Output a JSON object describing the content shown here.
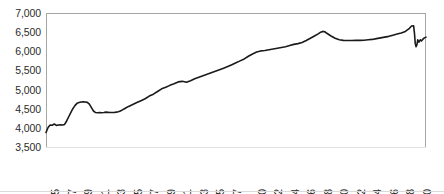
{
  "chart_data": {
    "type": "line",
    "title": "",
    "subtitle": "",
    "xlabel": "",
    "ylabel": "",
    "ylim": [
      3500,
      7000
    ],
    "ytick_labels": [
      "7,000",
      "6,500",
      "6,000",
      "5,500",
      "5,000",
      "4,500",
      "4,000",
      "3,500"
    ],
    "ytick_values": [
      7000,
      6500,
      6000,
      5500,
      5000,
      4500,
      4000,
      3500
    ],
    "xtick_labels": [
      "1975",
      "1977",
      "1979",
      "1981",
      "1983",
      "1985",
      "1987",
      "1989",
      "1991",
      "1993",
      "1995",
      "1997",
      "2000",
      "2002",
      "2004",
      "2006",
      "2008",
      "2010",
      "2012",
      "2014",
      "2016",
      "2018",
      "2020"
    ],
    "xtick_values": [
      1975,
      1977,
      1979,
      1981,
      1983,
      1985,
      1987,
      1989,
      1991,
      1993,
      1995,
      1997,
      2000,
      2002,
      2004,
      2006,
      2008,
      2010,
      2012,
      2014,
      2016,
      2018,
      2020
    ],
    "xlim": [
      1975,
      2021
    ],
    "grid": false,
    "legend": null,
    "line_color": "#1a1a1a",
    "line_width": 1.6,
    "axis_color": "#a6a6a6",
    "series": [
      {
        "name": "series-1",
        "x": [
          1975.0,
          1975.25,
          1975.5,
          1975.75,
          1976.0,
          1976.25,
          1976.5,
          1976.75,
          1977.0,
          1977.25,
          1977.5,
          1977.75,
          1978.0,
          1978.25,
          1978.5,
          1978.75,
          1979.0,
          1979.25,
          1979.5,
          1979.75,
          1980.0,
          1980.25,
          1980.5,
          1980.75,
          1981.0,
          1981.25,
          1981.5,
          1981.75,
          1982.0,
          1982.25,
          1982.5,
          1982.75,
          1983.0,
          1983.25,
          1983.5,
          1983.75,
          1984.0,
          1984.25,
          1984.5,
          1984.75,
          1985.0,
          1985.5,
          1986.0,
          1986.5,
          1987.0,
          1987.5,
          1988.0,
          1988.5,
          1989.0,
          1989.5,
          1990.0,
          1990.5,
          1991.0,
          1991.5,
          1992.0,
          1992.5,
          1993.0,
          1993.5,
          1994.0,
          1994.5,
          1995.0,
          1995.5,
          1996.0,
          1996.5,
          1997.0,
          1997.5,
          1998.0,
          1998.5,
          1999.0,
          1999.5,
          2000.0,
          2000.5,
          2001.0,
          2001.5,
          2002.0,
          2002.5,
          2003.0,
          2003.5,
          2004.0,
          2004.5,
          2005.0,
          2005.5,
          2006.0,
          2006.5,
          2007.0,
          2007.5,
          2008.0,
          2008.25,
          2008.5,
          2008.75,
          2009.0,
          2009.5,
          2010.0,
          2010.5,
          2011.0,
          2011.5,
          2012.0,
          2012.5,
          2013.0,
          2013.5,
          2014.0,
          2014.5,
          2015.0,
          2015.5,
          2016.0,
          2016.5,
          2017.0,
          2017.5,
          2018.0,
          2018.5,
          2019.0,
          2019.25,
          2019.5,
          2019.6,
          2019.7,
          2019.8,
          2019.9,
          2020.0,
          2020.15,
          2020.3,
          2020.45,
          2020.6,
          2020.8,
          2021.0
        ],
        "y": [
          3880,
          4010,
          4075,
          4070,
          4100,
          4065,
          4075,
          4080,
          4075,
          4090,
          4180,
          4290,
          4400,
          4500,
          4580,
          4640,
          4660,
          4675,
          4680,
          4675,
          4665,
          4620,
          4530,
          4440,
          4400,
          4395,
          4400,
          4395,
          4400,
          4410,
          4405,
          4400,
          4400,
          4400,
          4410,
          4420,
          4440,
          4470,
          4500,
          4530,
          4560,
          4610,
          4660,
          4710,
          4760,
          4830,
          4880,
          4950,
          5020,
          5060,
          5110,
          5150,
          5200,
          5215,
          5190,
          5230,
          5280,
          5320,
          5360,
          5400,
          5440,
          5480,
          5520,
          5560,
          5600,
          5650,
          5700,
          5750,
          5800,
          5870,
          5930,
          5980,
          6010,
          6020,
          6040,
          6060,
          6080,
          6100,
          6120,
          6150,
          6180,
          6200,
          6230,
          6280,
          6340,
          6400,
          6460,
          6500,
          6520,
          6510,
          6470,
          6400,
          6340,
          6300,
          6285,
          6280,
          6280,
          6285,
          6285,
          6290,
          6300,
          6310,
          6330,
          6350,
          6370,
          6390,
          6420,
          6450,
          6480,
          6520,
          6600,
          6660,
          6665,
          6480,
          6200,
          6120,
          6170,
          6300,
          6240,
          6300,
          6270,
          6310,
          6350,
          6370
        ]
      }
    ]
  },
  "axes": {
    "y_axis_name": "value-axis",
    "x_axis_name": "year-axis"
  }
}
